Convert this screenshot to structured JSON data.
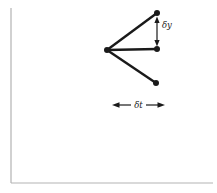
{
  "figure": {
    "type": "diagram",
    "labels": {
      "dy": "δy",
      "dt": "δt"
    },
    "colors": {
      "ink": "#1a1a1a",
      "axis": "#b3b3b3",
      "background": "#ffffff"
    }
  }
}
